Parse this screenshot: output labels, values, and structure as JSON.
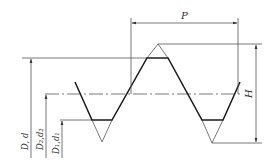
{
  "diagram": {
    "labels": {
      "pitch": "P",
      "height": "H",
      "major_diameter": "D, d",
      "pitch_diameter": "D₂,d₂",
      "minor_diameter": "D₁,d₁"
    },
    "colors": {
      "profile": "#1a1a1a",
      "dimension_lines": "#555555",
      "background": "#ffffff"
    }
  }
}
